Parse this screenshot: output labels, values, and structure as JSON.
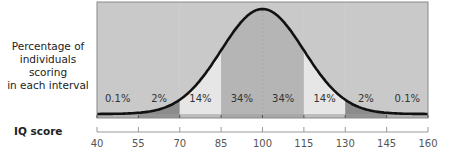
{
  "chart_data": {
    "type": "area",
    "title": "",
    "ylabel": "Percentage of individuals scoring in each interval",
    "xlabel": "IQ score",
    "x_ticks": [
      40,
      55,
      70,
      85,
      100,
      115,
      130,
      145,
      160
    ],
    "xlim": [
      40,
      160
    ],
    "distribution": {
      "kind": "normal",
      "mean": 100,
      "sd": 15
    },
    "intervals": [
      {
        "from": 40,
        "to": 55,
        "label": "0.1%",
        "value": 0.1
      },
      {
        "from": 55,
        "to": 70,
        "label": "2%",
        "value": 2
      },
      {
        "from": 70,
        "to": 85,
        "label": "14%",
        "value": 14
      },
      {
        "from": 85,
        "to": 100,
        "label": "34%",
        "value": 34
      },
      {
        "from": 100,
        "to": 115,
        "label": "34%",
        "value": 34
      },
      {
        "from": 115,
        "to": 130,
        "label": "14%",
        "value": 14
      },
      {
        "from": 130,
        "to": 145,
        "label": "2%",
        "value": 2
      },
      {
        "from": 145,
        "to": 160,
        "label": "0.1%",
        "value": 0.1
      }
    ],
    "grid": false,
    "legend": null
  },
  "labels": {
    "ylabel_lines": [
      "Percentage of",
      "individuals scoring",
      "in each interval"
    ],
    "xlabel": "IQ score"
  },
  "colors": {
    "background": "#c9c9c9",
    "band_34": "#b5b5b5",
    "band_14": "#e6e6e6",
    "band_2": "#8c8c8c",
    "band_01_strip": "#9a9a9a",
    "curve": "#111111",
    "frame": "#8a8a8a",
    "axis": "#999999",
    "text": "#333333"
  }
}
